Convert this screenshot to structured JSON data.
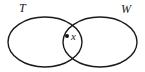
{
  "figure": {
    "type": "venn-diagram",
    "width": 145,
    "height": 72,
    "background_color": "#ffffff",
    "stroke_color": "#1a1a1a",
    "sets": [
      {
        "id": "T",
        "label": "T",
        "label_position": "top-left",
        "center_x": 45,
        "center_y": 42,
        "radius_x": 37,
        "radius_y": 25
      },
      {
        "id": "W",
        "label": "W",
        "label_position": "top-right",
        "center_x": 100,
        "center_y": 42,
        "radius_x": 37,
        "radius_y": 25
      }
    ],
    "points": [
      {
        "id": "x",
        "label": "x",
        "region": "intersection",
        "dot_x": 67,
        "dot_y": 36,
        "dot_radius": 2,
        "dot_color": "#111111"
      }
    ]
  }
}
